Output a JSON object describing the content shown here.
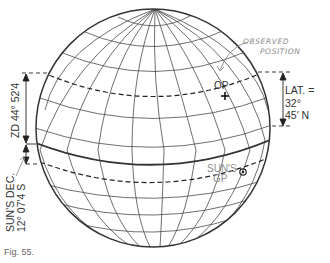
{
  "figure": {
    "caption": "Fig. 55.",
    "colors": {
      "line": "#3a3a3a",
      "annotation_pencil": "#8a8a8a",
      "background": "#ffffff"
    }
  },
  "globe": {
    "meridian_count": 12,
    "parallel_count": 10,
    "equator_style": "bold solid",
    "observer_parallel_style": "dashed",
    "sun_gp_parallel_style": "dashed"
  },
  "labels": {
    "observed_position": [
      "OBSERVED",
      "POSITION"
    ],
    "op": "OP",
    "lat": [
      "LAT. =",
      "32°",
      "45′ N"
    ],
    "zd": "ZD 44° 52′4",
    "sun_dec": [
      "SUN'S DEC.",
      "12° 07′4 S"
    ],
    "sun_gp": [
      "SUN'S",
      "GP"
    ]
  },
  "markers": {
    "observer": {
      "label": "OP",
      "symbol": "cross"
    },
    "sun_gp": {
      "label": "SUN'S GP",
      "symbol": "circled-dot"
    }
  },
  "measurements": {
    "latitude": "32° 45′ N",
    "zenith_distance": "44° 52′4",
    "sun_declination": "12° 07′4 S"
  }
}
